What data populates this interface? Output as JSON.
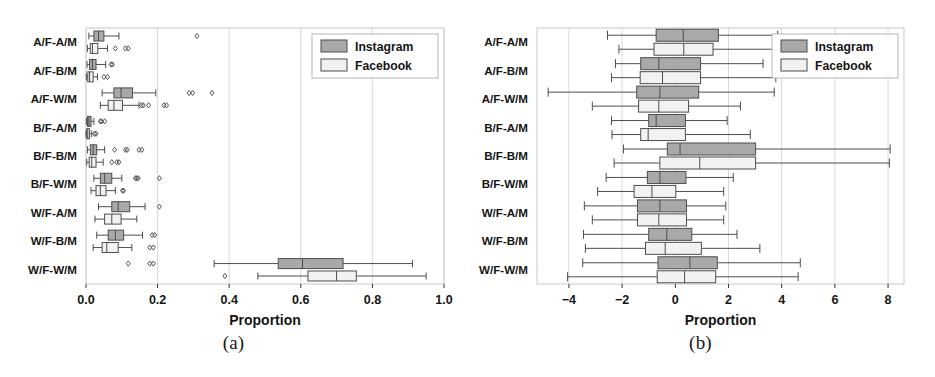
{
  "figure": {
    "panels": [
      {
        "caption": "(a)",
        "xlabel": "Proportion",
        "legend": [
          {
            "label": "Instagram",
            "color": "#a9a9a9"
          },
          {
            "label": "Facebook",
            "color": "#f2f2f2"
          }
        ]
      },
      {
        "caption": "(b)",
        "xlabel": "Proportion",
        "legend": [
          {
            "label": "Instagram",
            "color": "#a9a9a9"
          },
          {
            "label": "Facebook",
            "color": "#f2f2f2"
          }
        ]
      }
    ]
  },
  "chart_data": [
    {
      "type": "box",
      "panel": "(a)",
      "title": "",
      "xlabel": "Proportion",
      "ylabel": "",
      "xlim": [
        0.0,
        1.0
      ],
      "xticks": [
        0.0,
        0.2,
        0.4,
        0.6,
        0.8,
        1.0
      ],
      "xticklabels": [
        "0.0",
        "0.2",
        "0.4",
        "0.6",
        "0.8",
        "1.0"
      ],
      "categories": [
        "A/F-A/M",
        "A/F-B/M",
        "A/F-W/M",
        "B/F-A/M",
        "B/F-B/M",
        "B/F-W/M",
        "W/F-A/M",
        "W/F-B/M",
        "W/F-W/M"
      ],
      "grid": true,
      "legend_position": "upper right",
      "series": [
        {
          "name": "Instagram",
          "color": "#a9a9a9",
          "boxes": [
            {
              "category": "A/F-A/M",
              "whisker_low": 0.008,
              "q1": 0.022,
              "median": 0.035,
              "q3": 0.05,
              "whisker_high": 0.092,
              "outliers": [
                0.31
              ]
            },
            {
              "category": "A/F-B/M",
              "whisker_low": 0.003,
              "q1": 0.01,
              "median": 0.018,
              "q3": 0.028,
              "whisker_high": 0.055,
              "outliers": [
                0.07,
                0.074
              ]
            },
            {
              "category": "A/F-W/M",
              "whisker_low": 0.045,
              "q1": 0.078,
              "median": 0.098,
              "q3": 0.13,
              "whisker_high": 0.195,
              "outliers": [
                0.288,
                0.298,
                0.352
              ]
            },
            {
              "category": "B/F-A/M",
              "whisker_low": 0.001,
              "q1": 0.004,
              "median": 0.008,
              "q3": 0.014,
              "whisker_high": 0.022,
              "outliers": [
                0.04,
                0.043,
                0.052
              ]
            },
            {
              "category": "B/F-B/M",
              "whisker_low": 0.004,
              "q1": 0.012,
              "median": 0.02,
              "q3": 0.03,
              "whisker_high": 0.052,
              "outliers": [
                0.08,
                0.11,
                0.115,
                0.148,
                0.156
              ]
            },
            {
              "category": "B/F-W/M",
              "whisker_low": 0.022,
              "q1": 0.04,
              "median": 0.052,
              "q3": 0.072,
              "whisker_high": 0.1,
              "outliers": [
                0.138,
                0.142,
                0.146,
                0.205
              ]
            },
            {
              "category": "W/F-A/M",
              "whisker_low": 0.035,
              "q1": 0.072,
              "median": 0.09,
              "q3": 0.122,
              "whisker_high": 0.165,
              "outliers": [
                0.205
              ]
            },
            {
              "category": "W/F-B/M",
              "whisker_low": 0.03,
              "q1": 0.062,
              "median": 0.082,
              "q3": 0.105,
              "whisker_high": 0.158,
              "outliers": [
                0.185,
                0.192
              ]
            },
            {
              "category": "W/F-W/M",
              "whisker_low": 0.358,
              "q1": 0.537,
              "median": 0.605,
              "q3": 0.718,
              "whisker_high": 0.912,
              "outliers": [
                0.118,
                0.178,
                0.188
              ]
            }
          ]
        },
        {
          "name": "Facebook",
          "color": "#f2f2f2",
          "boxes": [
            {
              "category": "A/F-A/M",
              "whisker_low": 0.004,
              "q1": 0.012,
              "median": 0.018,
              "q3": 0.033,
              "whisker_high": 0.06,
              "outliers": [
                0.082,
                0.11,
                0.118
              ]
            },
            {
              "category": "A/F-B/M",
              "whisker_low": 0.001,
              "q1": 0.005,
              "median": 0.01,
              "q3": 0.02,
              "whisker_high": 0.032,
              "outliers": [
                0.05,
                0.06
              ]
            },
            {
              "category": "A/F-W/M",
              "whisker_low": 0.04,
              "q1": 0.062,
              "median": 0.078,
              "q3": 0.102,
              "whisker_high": 0.148,
              "outliers": [
                0.155,
                0.16,
                0.175,
                0.218,
                0.225
              ]
            },
            {
              "category": "B/F-A/M",
              "whisker_low": 0.0,
              "q1": 0.002,
              "median": 0.005,
              "q3": 0.01,
              "whisker_high": 0.016,
              "outliers": [
                0.024,
                0.028
              ]
            },
            {
              "category": "B/F-B/M",
              "whisker_low": 0.002,
              "q1": 0.009,
              "median": 0.016,
              "q3": 0.028,
              "whisker_high": 0.048,
              "outliers": [
                0.072,
                0.086,
                0.092
              ]
            },
            {
              "category": "B/F-W/M",
              "whisker_low": 0.014,
              "q1": 0.028,
              "median": 0.04,
              "q3": 0.056,
              "whisker_high": 0.082,
              "outliers": [
                0.102,
                0.105
              ]
            },
            {
              "category": "W/F-A/M",
              "whisker_low": 0.025,
              "q1": 0.052,
              "median": 0.072,
              "q3": 0.098,
              "whisker_high": 0.142,
              "outliers": []
            },
            {
              "category": "W/F-B/M",
              "whisker_low": 0.02,
              "q1": 0.045,
              "median": 0.058,
              "q3": 0.09,
              "whisker_high": 0.128,
              "outliers": [
                0.178,
                0.188
              ]
            },
            {
              "category": "W/F-W/M",
              "whisker_low": 0.48,
              "q1": 0.62,
              "median": 0.7,
              "q3": 0.755,
              "whisker_high": 0.95,
              "outliers": [
                0.388
              ]
            }
          ]
        }
      ]
    },
    {
      "type": "box",
      "panel": "(b)",
      "title": "",
      "xlabel": "Proportion",
      "ylabel": "",
      "xlim": [
        -5.2,
        8.6
      ],
      "xticks": [
        -4,
        -2,
        0,
        2,
        4,
        6,
        8
      ],
      "xticklabels": [
        "−4",
        "−2",
        "0",
        "2",
        "4",
        "6",
        "8"
      ],
      "categories": [
        "A/F-A/M",
        "A/F-B/M",
        "A/F-W/M",
        "B/F-A/M",
        "B/F-B/M",
        "B/F-W/M",
        "W/F-A/M",
        "W/F-B/M",
        "W/F-W/M"
      ],
      "grid": true,
      "legend_position": "upper right",
      "series": [
        {
          "name": "Instagram",
          "color": "#a9a9a9",
          "boxes": [
            {
              "category": "A/F-A/M",
              "whisker_low": -2.55,
              "q1": -0.72,
              "median": 0.3,
              "q3": 1.62,
              "whisker_high": 3.85,
              "outliers": []
            },
            {
              "category": "A/F-B/M",
              "whisker_low": -2.25,
              "q1": -1.3,
              "median": -0.62,
              "q3": 0.95,
              "whisker_high": 3.3,
              "outliers": []
            },
            {
              "category": "A/F-W/M",
              "whisker_low": -4.78,
              "q1": -1.45,
              "median": -0.58,
              "q3": 0.88,
              "whisker_high": 3.72,
              "outliers": []
            },
            {
              "category": "B/F-A/M",
              "whisker_low": -2.4,
              "q1": -1.0,
              "median": -0.72,
              "q3": 0.38,
              "whisker_high": 1.95,
              "outliers": []
            },
            {
              "category": "B/F-B/M",
              "whisker_low": -1.95,
              "q1": -0.3,
              "median": 0.18,
              "q3": 3.02,
              "whisker_high": 8.08,
              "outliers": []
            },
            {
              "category": "B/F-W/M",
              "whisker_low": -2.6,
              "q1": -1.05,
              "median": -0.58,
              "q3": 0.4,
              "whisker_high": 2.18,
              "outliers": []
            },
            {
              "category": "W/F-A/M",
              "whisker_low": -3.42,
              "q1": -1.42,
              "median": -0.58,
              "q3": 0.42,
              "whisker_high": 1.9,
              "outliers": []
            },
            {
              "category": "W/F-B/M",
              "whisker_low": -3.45,
              "q1": -1.0,
              "median": -0.32,
              "q3": 0.62,
              "whisker_high": 2.32,
              "outliers": []
            },
            {
              "category": "W/F-W/M",
              "whisker_low": -3.48,
              "q1": -0.65,
              "median": 0.55,
              "q3": 1.58,
              "whisker_high": 4.7,
              "outliers": []
            }
          ]
        },
        {
          "name": "Facebook",
          "color": "#f2f2f2",
          "boxes": [
            {
              "category": "A/F-A/M",
              "whisker_low": -2.12,
              "q1": -0.8,
              "median": 0.32,
              "q3": 1.42,
              "whisker_high": 4.05,
              "outliers": []
            },
            {
              "category": "A/F-B/M",
              "whisker_low": -2.4,
              "q1": -1.32,
              "median": -0.48,
              "q3": 0.95,
              "whisker_high": 3.78,
              "outliers": []
            },
            {
              "category": "A/F-W/M",
              "whisker_low": -3.12,
              "q1": -1.38,
              "median": -0.62,
              "q3": 0.5,
              "whisker_high": 2.45,
              "outliers": []
            },
            {
              "category": "B/F-A/M",
              "whisker_low": -2.38,
              "q1": -1.3,
              "median": -1.02,
              "q3": 0.38,
              "whisker_high": 2.82,
              "outliers": []
            },
            {
              "category": "B/F-B/M",
              "whisker_low": -2.3,
              "q1": -0.58,
              "median": 0.92,
              "q3": 3.02,
              "whisker_high": 8.05,
              "outliers": []
            },
            {
              "category": "B/F-W/M",
              "whisker_low": -2.92,
              "q1": -1.55,
              "median": -0.88,
              "q3": 0.02,
              "whisker_high": 1.82,
              "outliers": []
            },
            {
              "category": "W/F-A/M",
              "whisker_low": -3.12,
              "q1": -1.42,
              "median": -0.62,
              "q3": 0.42,
              "whisker_high": 1.82,
              "outliers": []
            },
            {
              "category": "W/F-B/M",
              "whisker_low": -3.38,
              "q1": -1.12,
              "median": -0.38,
              "q3": 0.98,
              "whisker_high": 3.18,
              "outliers": []
            },
            {
              "category": "W/F-W/M",
              "whisker_low": -4.05,
              "q1": -0.68,
              "median": 0.35,
              "q3": 1.52,
              "whisker_high": 4.62,
              "outliers": []
            }
          ]
        }
      ]
    }
  ]
}
